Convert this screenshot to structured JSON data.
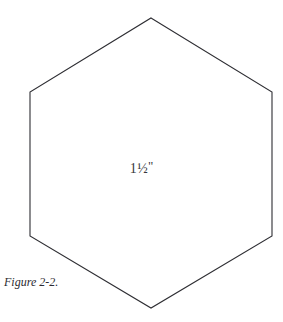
{
  "figure": {
    "caption": "Figure 2-2.",
    "background_color": "#ffffff",
    "stroke_color": "#2e2e33",
    "text_color": "#37373c"
  },
  "shape": {
    "name": "hexagon",
    "sides": 6,
    "orientation": "pointy-top",
    "fill": "none",
    "vertices": [
      [
        151,
        18
      ],
      [
        272,
        92
      ],
      [
        272,
        236
      ],
      [
        151,
        308
      ],
      [
        30,
        236
      ],
      [
        30,
        92
      ]
    ],
    "label": {
      "whole": "1",
      "fraction": "½",
      "unit_mark": "\"",
      "full_text": "1½\"",
      "meaning": "one and one half inches"
    }
  },
  "chart_data": {
    "type": "diagram",
    "title": "Figure 2-2.",
    "shape": "hexagon",
    "annotations": [
      {
        "text": "1½\"",
        "position": "center",
        "describes": "side length / dimension of hexagon"
      }
    ]
  }
}
